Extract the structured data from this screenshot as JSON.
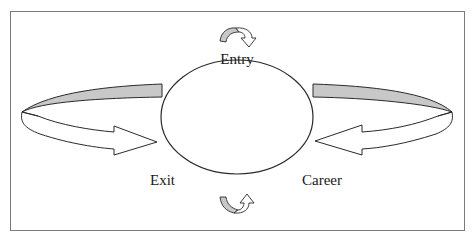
{
  "diagram": {
    "center_shape": "ellipse",
    "labels": {
      "entry": "Entry",
      "exit": "Exit",
      "career": "Career"
    },
    "arrows": [
      {
        "name": "left-wrap-arrow",
        "direction": "right",
        "points_to": "center"
      },
      {
        "name": "right-wrap-arrow",
        "direction": "left",
        "points_to": "center"
      },
      {
        "name": "top-curl-arrow",
        "position": "above Entry"
      },
      {
        "name": "bottom-curl-arrow",
        "position": "below circle"
      }
    ],
    "colors": {
      "stroke": "#2a2a2a",
      "band_fill": "#c8c8c8",
      "frame": "#7a7a7a",
      "background": "#ffffff"
    }
  }
}
